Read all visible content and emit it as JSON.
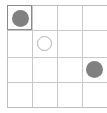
{
  "widget": {
    "name": "grid-board",
    "rows": 4,
    "columns": 4,
    "cell_width": 25,
    "cell_height": 25,
    "background_color": "#ffffff",
    "grid_line_color": "#c8c8c8",
    "frame_line_color": "#bdbdbd",
    "selected_border_color": "#8a8a8a",
    "right_edge_clipped": "true"
  },
  "tokens": {
    "filled_color": "#808080",
    "outline_stroke_color": "#b4b4b4",
    "filled_diameter": 17,
    "outline_diameter": 15
  },
  "cells": [
    {
      "row": 1,
      "column": 1,
      "content": "filled-circle",
      "selected": "true"
    },
    {
      "row": 1,
      "column": 2,
      "content": "empty",
      "selected": "false"
    },
    {
      "row": 1,
      "column": 3,
      "content": "empty",
      "selected": "false"
    },
    {
      "row": 1,
      "column": 4,
      "content": "empty",
      "selected": "false"
    },
    {
      "row": 2,
      "column": 1,
      "content": "empty",
      "selected": "false"
    },
    {
      "row": 2,
      "column": 2,
      "content": "outline-circle",
      "selected": "false"
    },
    {
      "row": 2,
      "column": 3,
      "content": "empty",
      "selected": "false"
    },
    {
      "row": 2,
      "column": 4,
      "content": "empty",
      "selected": "false"
    },
    {
      "row": 3,
      "column": 1,
      "content": "empty",
      "selected": "false"
    },
    {
      "row": 3,
      "column": 2,
      "content": "empty",
      "selected": "false"
    },
    {
      "row": 3,
      "column": 3,
      "content": "empty",
      "selected": "false"
    },
    {
      "row": 3,
      "column": 4,
      "content": "filled-circle",
      "selected": "false"
    },
    {
      "row": 4,
      "column": 1,
      "content": "empty",
      "selected": "false"
    },
    {
      "row": 4,
      "column": 2,
      "content": "empty",
      "selected": "false"
    },
    {
      "row": 4,
      "column": 3,
      "content": "empty",
      "selected": "false"
    },
    {
      "row": 4,
      "column": 4,
      "content": "empty",
      "selected": "false"
    }
  ],
  "column_x": [
    0,
    25,
    50,
    75,
    100
  ],
  "row_y": [
    0,
    25,
    52,
    77,
    102
  ]
}
